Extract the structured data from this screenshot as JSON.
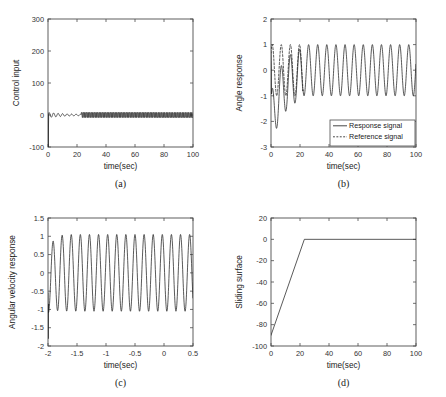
{
  "figure": {
    "background": "#ffffff",
    "line_color": "#232323",
    "axis_color": "#4d4d4d",
    "panel_count": 4
  },
  "chart_data": [
    {
      "id": "a",
      "type": "line",
      "caption": "(a)",
      "title": "",
      "xlabel": "time(sec)",
      "ylabel": "Control input",
      "xlim": [
        0,
        100
      ],
      "ylim": [
        -100,
        300
      ],
      "xticks": [
        0,
        20,
        40,
        60,
        80,
        100
      ],
      "yticks": [
        -100,
        0,
        100,
        200,
        300
      ],
      "xticklabels": [
        "0",
        "20",
        "40",
        "60",
        "80",
        "100"
      ],
      "yticklabels": [
        "-100",
        "0",
        "100",
        "200",
        "300"
      ],
      "grid": false,
      "legend": null,
      "series": [
        {
          "name": "Control input",
          "style": "solid",
          "description": "Initial negative impulse to -100 at t=0, small decaying oscillation about 0 until t=22, then dense high-frequency chattering band around 0 for t>23",
          "notes": {
            "initial_spike": -100,
            "early_oscillation_amplitude": 8,
            "early_oscillation_period": 3.1,
            "chatter_start_time": 23,
            "chatter_amplitude": 9,
            "chatter_period": 1.1,
            "steady_value": 0
          }
        }
      ]
    },
    {
      "id": "b",
      "type": "line",
      "caption": "(b)",
      "title": "",
      "xlabel": "time(sec)",
      "ylabel": "Angle response",
      "xlim": [
        0,
        100
      ],
      "ylim": [
        -3,
        2
      ],
      "xticks": [
        0,
        20,
        40,
        60,
        80,
        100
      ],
      "yticks": [
        -3,
        -2,
        -1,
        0,
        1,
        2
      ],
      "xticklabels": [
        "0",
        "20",
        "40",
        "60",
        "80",
        "100"
      ],
      "yticklabels": [
        "-3",
        "-2",
        "-1",
        "0",
        "1",
        "2"
      ],
      "grid": false,
      "legend": {
        "position": "lower right",
        "entries": [
          {
            "label": "Response signal",
            "style": "solid"
          },
          {
            "label": "Reference signal",
            "style": "dashed"
          }
        ]
      },
      "series": [
        {
          "name": "Response signal",
          "style": "solid",
          "description": "Starts near 0.7, undershoots to -2.9 near t=4, -2.3 near t=10, -1.6 near t=16, converges onto the reference sine by t=22 and then tracks amplitude 1 with period 6.28",
          "notes": {
            "transient_minima": [
              -2.9,
              -2.3,
              -1.6
            ],
            "transient_minima_times": [
              4,
              10,
              16
            ],
            "convergence_time": 22,
            "steady_amplitude": 1,
            "steady_period": 6.28
          }
        },
        {
          "name": "Reference signal",
          "style": "dashed",
          "description": "Sine of amplitude 1 and period 6.28 shown over the transient interval 0 to 22",
          "notes": {
            "amplitude": 1,
            "period": 6.28,
            "visible_range": [
              0,
              22
            ]
          }
        }
      ]
    },
    {
      "id": "c",
      "type": "line",
      "caption": "(c)",
      "title": "",
      "xlabel": "time(sec)",
      "ylabel": "Angular velocity response",
      "xlim": [
        0,
        100
      ],
      "ylim": [
        -2,
        1.5
      ],
      "xticks": [
        0,
        20,
        40,
        60,
        80,
        100
      ],
      "yticks": [
        -2,
        -1.5,
        -1,
        -0.5,
        0,
        0.5,
        1,
        1.5
      ],
      "xticklabels": [
        "-2",
        "-1.5",
        "-1",
        "-0.5",
        "0",
        "0.5",
        "1",
        "1.5"
      ],
      "yticklabels": [
        "-2",
        "-1.5",
        "-1",
        "-0.5",
        "0",
        "0.5",
        "1",
        "1.5"
      ],
      "grid": false,
      "legend": null,
      "series": [
        {
          "name": "Angular velocity response",
          "style": "solid",
          "description": "Sharp initial dip to -1.8 at t=0, brief settling near -0.8 then sustained oscillation of amplitude 1.05 with period 6.28 for the rest of the run",
          "notes": {
            "initial_dip": -1.8,
            "settle_time": 4,
            "steady_amplitude": 1.05,
            "steady_period": 6.28,
            "steady_offset": 0
          }
        }
      ]
    },
    {
      "id": "d",
      "type": "line",
      "caption": "(d)",
      "title": "",
      "xlabel": "time(sec)",
      "ylabel": "Sliding surface",
      "xlim": [
        0,
        100
      ],
      "ylim": [
        -100,
        20
      ],
      "xticks": [
        0,
        20,
        40,
        60,
        80,
        100
      ],
      "yticks": [
        -100,
        -80,
        -60,
        -40,
        -20,
        0,
        20
      ],
      "xticklabels": [
        "0",
        "20",
        "40",
        "60",
        "80",
        "100"
      ],
      "yticklabels": [
        "-100",
        "-80",
        "-60",
        "-40",
        "-20",
        "0",
        "20"
      ],
      "grid": false,
      "legend": null,
      "series": [
        {
          "name": "Sliding surface",
          "style": "solid",
          "description": "Linear ramp from -90 at t=0 up to 0 at t=23, then held at 0 for the remainder",
          "points": [
            [
              0,
              -90
            ],
            [
              23,
              0
            ],
            [
              100,
              0
            ]
          ]
        }
      ]
    }
  ]
}
